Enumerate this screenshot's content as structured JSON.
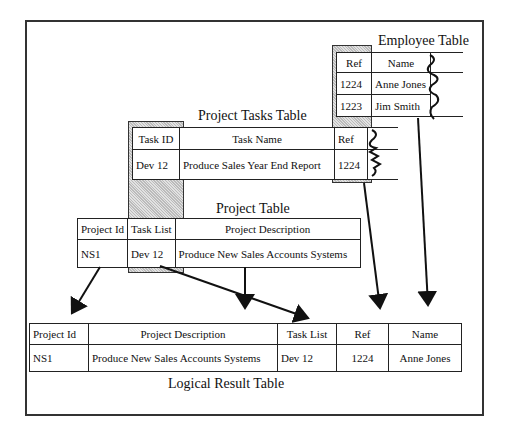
{
  "employee_table": {
    "title": "Employee Table",
    "headers": [
      "Ref",
      "Name"
    ],
    "rows": [
      [
        "1224",
        "Anne Jones"
      ],
      [
        "1223",
        "Jim Smith"
      ]
    ]
  },
  "tasks_table": {
    "title": "Project Tasks Table",
    "headers": [
      "Task ID",
      "Task Name",
      "Ref"
    ],
    "rows": [
      [
        "Dev 12",
        "Produce Sales Year End Report",
        "1224"
      ]
    ]
  },
  "project_table": {
    "title": "Project Table",
    "headers": [
      "Project Id",
      "Task List",
      "Project Description"
    ],
    "rows": [
      [
        "NS1",
        "Dev 12",
        "Produce New Sales Accounts Systems"
      ]
    ]
  },
  "result_table": {
    "title": "Logical Result Table",
    "headers": [
      "Project Id",
      "Project Description",
      "Task List",
      "Ref",
      "Name"
    ],
    "rows": [
      [
        "NS1",
        "Produce New Sales Accounts Systems",
        "Dev 12",
        "1224",
        "Anne Jones"
      ]
    ]
  }
}
